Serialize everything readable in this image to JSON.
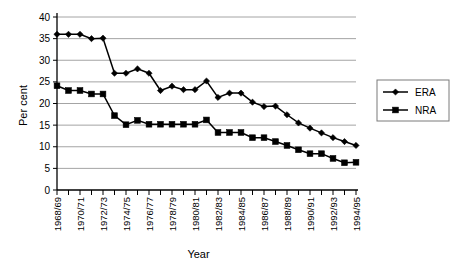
{
  "chart_data": {
    "type": "line",
    "title": "",
    "xlabel": "Year",
    "ylabel": "Per cent",
    "ylim": [
      0,
      40
    ],
    "ytick_step": 5,
    "yticks": [
      "0",
      "5",
      "10",
      "15",
      "20",
      "25",
      "30",
      "35",
      "40"
    ],
    "grid": true,
    "legend_position": "right",
    "x": [
      "1968/69",
      "1969/70",
      "1970/71",
      "1971/72",
      "1972/73",
      "1973/74",
      "1974/75",
      "1975/76",
      "1976/77",
      "1977/78",
      "1978/79",
      "1979/80",
      "1980/81",
      "1981/82",
      "1982/83",
      "1983/84",
      "1984/85",
      "1985/86",
      "1986/87",
      "1987/88",
      "1988/89",
      "1989/90",
      "1990/91",
      "1991/92",
      "1992/93",
      "1993/94",
      "1994/95"
    ],
    "xtick_labels_shown": [
      "1968/69",
      "1970/71",
      "1972/73",
      "1974/75",
      "1976/77",
      "1978/79",
      "1980/81",
      "1982/83",
      "1984/85",
      "1986/87",
      "1988/89",
      "1990/91",
      "1992/93",
      "1994/95"
    ],
    "series": [
      {
        "name": "ERA",
        "marker": "diamond",
        "color": "#000000",
        "values": [
          36.0,
          36.0,
          36.0,
          35.0,
          35.1,
          27.0,
          27.0,
          28.0,
          27.0,
          23.0,
          24.0,
          23.2,
          23.2,
          25.2,
          21.4,
          22.4,
          22.4,
          20.3,
          19.3,
          19.4,
          17.4,
          15.5,
          14.3,
          13.2,
          12.1,
          11.2,
          10.3
        ]
      },
      {
        "name": "NRA",
        "marker": "square",
        "color": "#000000",
        "values": [
          24.1,
          23.0,
          23.0,
          22.2,
          22.2,
          17.2,
          15.1,
          16.1,
          15.2,
          15.2,
          15.2,
          15.2,
          15.2,
          16.2,
          13.3,
          13.3,
          13.3,
          12.1,
          12.1,
          11.2,
          10.3,
          9.3,
          8.4,
          8.4,
          7.3,
          6.3,
          6.4
        ]
      }
    ]
  },
  "legend": {
    "entries": [
      {
        "label": "ERA"
      },
      {
        "label": "NRA"
      }
    ]
  }
}
